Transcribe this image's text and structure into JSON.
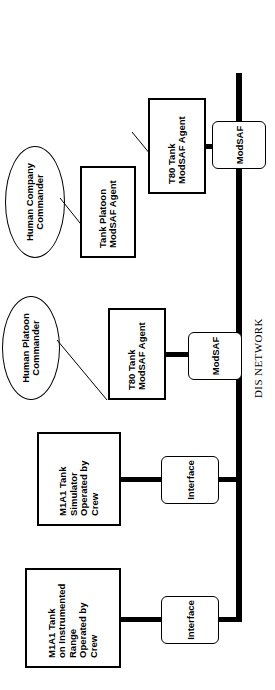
{
  "diagram": {
    "bus_label": "DIS NETWORK",
    "colors": {
      "stroke": "#000000",
      "fill": "#ffffff",
      "bus": "#000000"
    },
    "commanders": [
      {
        "id": "human-company-commander",
        "label": "Human Company\nCommander"
      },
      {
        "id": "human-platoon-commander",
        "label": "Human Platoon\nCommander"
      }
    ],
    "agents": [
      {
        "id": "tank-platoon-modsaf-agent",
        "label": "Tank Platoon\nModSAF Agent"
      },
      {
        "id": "t80-tank-modsaf-agent-upper",
        "label": "T80 Tank\nModSAF Agent"
      },
      {
        "id": "t80-tank-modsaf-agent-lower",
        "label": "T80 Tank\nModSAF Agent"
      }
    ],
    "entities": [
      {
        "id": "m1a1-tank-simulator",
        "label": "M1A1 Tank\nSimulator\nOperated by\nCrew"
      },
      {
        "id": "m1a1-tank-instrumented-range",
        "label": "M1A1 Tank\non Instrumented\nRange\nOperated by\nCrew"
      }
    ],
    "network_nodes": [
      {
        "id": "modsaf-upper",
        "label": "ModSAF"
      },
      {
        "id": "modsaf-lower",
        "label": "ModSAF"
      },
      {
        "id": "interface-simulator",
        "label": "Interface"
      },
      {
        "id": "interface-range",
        "label": "Interface"
      }
    ]
  }
}
